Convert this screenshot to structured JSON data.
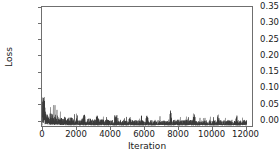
{
  "chart_data": {
    "type": "line",
    "title": "",
    "xlabel": "Iteration",
    "ylabel": "Loss",
    "xlim": [
      0,
      12400
    ],
    "ylim": [
      0,
      0.372
    ],
    "grid": false,
    "legend": null,
    "series_color": "#3a3a3a",
    "axis_color": "#6f6f6f",
    "xticks": [
      0,
      2000,
      4000,
      6000,
      8000,
      10000,
      12000
    ],
    "xtick_labels": [
      "0",
      "2000",
      "4000",
      "6000",
      "8000",
      "10000",
      "12000"
    ],
    "yticks": [
      0.0,
      0.05,
      0.1,
      0.15,
      0.2,
      0.25,
      0.3,
      0.35
    ],
    "ytick_labels": [
      "0.00",
      "0.05",
      "0.10",
      "0.15",
      "0.20",
      "0.25",
      "0.30",
      "0.35"
    ],
    "x": [
      0,
      40,
      80,
      120,
      160,
      200,
      240,
      280,
      320,
      360,
      400,
      440,
      480,
      520,
      560,
      600,
      650,
      700,
      750,
      800,
      850,
      900,
      950,
      1000,
      1060,
      1120,
      1180,
      1240,
      1300,
      1360,
      1420,
      1480,
      1540,
      1600,
      1660,
      1720,
      1780,
      1840,
      1900,
      1960,
      2020,
      2080,
      2140,
      2200,
      2260,
      2320,
      2380,
      2440,
      2500,
      2560,
      2620,
      2680,
      2740,
      2800,
      2860,
      2920,
      2980,
      3040,
      3100,
      3160,
      3220,
      3280,
      3340,
      3400,
      3460,
      3520,
      3580,
      3640,
      3700,
      3760,
      3820,
      3880,
      3940,
      4000,
      4060,
      4120,
      4180,
      4240,
      4300,
      4360,
      4420,
      4480,
      4540,
      4600,
      4660,
      4720,
      4780,
      4840,
      4900,
      4960,
      5020,
      5080,
      5140,
      5200,
      5260,
      5320,
      5380,
      5440,
      5500,
      5560,
      5620,
      5680,
      5740,
      5800,
      5860,
      5920,
      5980,
      6040,
      6100,
      6160,
      6220,
      6280,
      6340,
      6400,
      6460,
      6520,
      6580,
      6640,
      6700,
      6760,
      6820,
      6880,
      6940,
      7000,
      7060,
      7120,
      7180,
      7240,
      7300,
      7360,
      7420,
      7480,
      7540,
      7600,
      7660,
      7720,
      7780,
      7840,
      7900,
      7960,
      8020,
      8080,
      8140,
      8200,
      8260,
      8320,
      8380,
      8440,
      8500,
      8560,
      8620,
      8680,
      8740,
      8800,
      8860,
      8920,
      8980,
      9040,
      9100,
      9160,
      9220,
      9280,
      9340,
      9400,
      9460,
      9520,
      9580,
      9640,
      9700,
      9760,
      9820,
      9880,
      9940,
      10000,
      10060,
      10120,
      10180,
      10240,
      10300,
      10360,
      10420,
      10480,
      10540,
      10600,
      10660,
      10720,
      10780,
      10840,
      10900,
      10960,
      11020,
      11080,
      11140,
      11200,
      11260,
      11320,
      11380,
      11440,
      11500,
      11560,
      11620,
      11680,
      11740,
      11800,
      11860,
      11920,
      11980,
      12040,
      12100,
      12160,
      12220,
      12280,
      12340,
      12400
    ],
    "y": [
      0.004,
      0.075,
      0.056,
      0.044,
      0.038,
      0.033,
      0.03,
      0.028,
      0.026,
      0.025,
      0.024,
      0.023,
      0.022,
      0.021,
      0.021,
      0.02,
      0.02,
      0.019,
      0.019,
      0.018,
      0.018,
      0.017,
      0.017,
      0.017,
      0.016,
      0.016,
      0.016,
      0.015,
      0.015,
      0.015,
      0.015,
      0.014,
      0.014,
      0.014,
      0.014,
      0.014,
      0.013,
      0.013,
      0.013,
      0.013,
      0.013,
      0.013,
      0.013,
      0.012,
      0.012,
      0.012,
      0.012,
      0.012,
      0.012,
      0.012,
      0.012,
      0.012,
      0.012,
      0.012,
      0.012,
      0.011,
      0.011,
      0.011,
      0.011,
      0.011,
      0.011,
      0.011,
      0.011,
      0.011,
      0.011,
      0.011,
      0.011,
      0.011,
      0.011,
      0.011,
      0.011,
      0.011,
      0.01,
      0.01,
      0.01,
      0.01,
      0.01,
      0.01,
      0.01,
      0.01,
      0.01,
      0.01,
      0.01,
      0.01,
      0.01,
      0.01,
      0.01,
      0.01,
      0.01,
      0.01,
      0.01,
      0.01,
      0.01,
      0.01,
      0.01,
      0.01,
      0.01,
      0.01,
      0.01,
      0.01,
      0.01,
      0.01,
      0.01,
      0.01,
      0.01,
      0.01,
      0.01,
      0.01,
      0.01,
      0.01,
      0.01,
      0.01,
      0.01,
      0.01,
      0.01,
      0.01,
      0.01,
      0.01,
      0.01,
      0.01,
      0.01,
      0.01,
      0.01,
      0.01,
      0.01,
      0.01,
      0.01,
      0.01,
      0.01,
      0.01,
      0.01,
      0.01,
      0.01,
      0.01,
      0.01,
      0.01,
      0.01,
      0.01,
      0.01,
      0.01,
      0.01,
      0.01,
      0.01,
      0.01,
      0.01,
      0.01,
      0.01,
      0.01,
      0.01,
      0.01,
      0.01,
      0.01,
      0.01,
      0.01,
      0.01,
      0.01,
      0.01,
      0.01,
      0.01,
      0.01,
      0.01,
      0.01,
      0.01,
      0.01,
      0.01,
      0.01,
      0.01,
      0.01,
      0.01,
      0.01,
      0.01,
      0.01,
      0.01,
      0.01,
      0.01,
      0.01,
      0.01,
      0.01,
      0.01,
      0.01,
      0.01,
      0.01,
      0.01,
      0.01,
      0.01,
      0.01,
      0.01,
      0.01,
      0.01,
      0.01,
      0.01,
      0.01,
      0.01,
      0.01,
      0.01,
      0.01,
      0.01,
      0.01,
      0.01,
      0.01,
      0.01,
      0.01,
      0.01,
      0.01,
      0.01,
      0.01,
      0.01,
      0.01,
      0.01
    ],
    "noise_peaks": [
      {
        "x": 120,
        "y": 0.075
      },
      {
        "x": 2480,
        "y": 0.032
      },
      {
        "x": 3280,
        "y": 0.029
      },
      {
        "x": 4350,
        "y": 0.03
      },
      {
        "x": 5200,
        "y": 0.031
      },
      {
        "x": 6200,
        "y": 0.03
      },
      {
        "x": 7600,
        "y": 0.045
      },
      {
        "x": 9000,
        "y": 0.028
      },
      {
        "x": 10400,
        "y": 0.029
      },
      {
        "x": 11500,
        "y": 0.03
      }
    ]
  }
}
